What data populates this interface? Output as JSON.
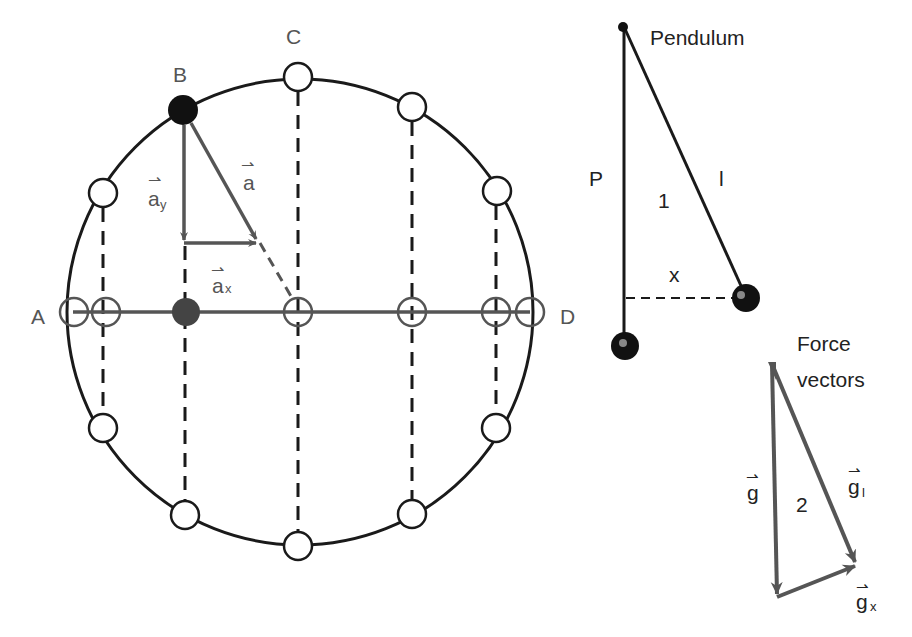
{
  "diagram": {
    "circle_diagram": {
      "labels": {
        "A": "A",
        "B": "B",
        "C": "C",
        "D": "D"
      },
      "vectors": {
        "a": "a",
        "a_y": "a",
        "a_y_sub": "y",
        "a_x": "a",
        "a_x_sub": "x",
        "arrow_glyph": "⇀"
      }
    },
    "pendulum": {
      "title": "Pendulum",
      "label_P": "P",
      "label_l": "l",
      "label_1": "1",
      "label_x": "x"
    },
    "force_vectors": {
      "title_line1": "Force",
      "title_line2": "vectors",
      "label_2": "2",
      "g": "g",
      "g_l": "g",
      "g_l_sub": "l",
      "g_x": "g",
      "g_x_sub": "x"
    },
    "colors": {
      "ink": "#1a1a1a",
      "vector_gray": "#555555",
      "filled_ball": "#111111",
      "projection_ball": "#444444"
    }
  }
}
